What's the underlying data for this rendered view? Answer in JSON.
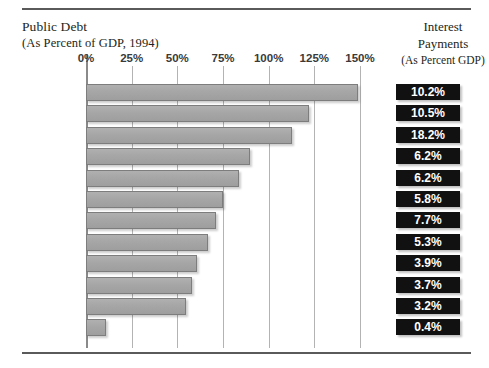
{
  "header": {
    "left_title": "Public Debt",
    "left_subtitle": "(As Percent of GDP, 1994)",
    "right_title_line1": "Interest",
    "right_title_line2": "Payments",
    "right_subtitle": "(As Percent GDP)"
  },
  "chart_data": {
    "type": "bar",
    "orientation": "horizontal",
    "title": "Public Debt",
    "subtitle": "(As Percent of GDP, 1994)",
    "xlabel": "",
    "ylabel": "",
    "xlim": [
      0,
      150
    ],
    "grid": true,
    "legend": "none",
    "tick_labels": [
      "0%",
      "25%",
      "50%",
      "75%",
      "100%",
      "125%",
      "150%"
    ],
    "tick_values": [
      0,
      25,
      50,
      75,
      100,
      125,
      150
    ],
    "categories": [
      "Belgium",
      "Italy",
      "Greece",
      "Ireland",
      "Holland",
      "Portugal",
      "Denmark",
      "Spain",
      "France",
      "Germany",
      "Britain",
      "Luxembourg"
    ],
    "values": [
      149,
      122,
      113,
      90,
      84,
      75,
      71,
      67,
      61,
      58,
      55,
      11
    ],
    "series": [
      {
        "name": "Public Debt (As Percent of GDP, 1994)",
        "values": [
          149,
          122,
          113,
          90,
          84,
          75,
          71,
          67,
          61,
          58,
          55,
          11
        ]
      },
      {
        "name": "Interest Payments (As Percent GDP)",
        "values": [
          10.2,
          10.5,
          18.2,
          6.2,
          6.2,
          5.8,
          7.7,
          5.3,
          3.9,
          3.7,
          3.2,
          0.4
        ],
        "labels": [
          "10.2%",
          "10.5%",
          "18.2%",
          "6.2%",
          "6.2%",
          "5.8%",
          "7.7%",
          "5.3%",
          "3.9%",
          "3.7%",
          "3.2%",
          "0.4%"
        ]
      }
    ],
    "rows": [
      {
        "country": "Belgium",
        "debt": 149,
        "interest": "10.2%"
      },
      {
        "country": "Italy",
        "debt": 122,
        "interest": "10.5%"
      },
      {
        "country": "Greece",
        "debt": 113,
        "interest": "18.2%"
      },
      {
        "country": "Ireland",
        "debt": 90,
        "interest": "6.2%"
      },
      {
        "country": "Holland",
        "debt": 84,
        "interest": "6.2%"
      },
      {
        "country": "Portugal",
        "debt": 75,
        "interest": "5.8%"
      },
      {
        "country": "Denmark",
        "debt": 71,
        "interest": "7.7%"
      },
      {
        "country": "Spain",
        "debt": 67,
        "interest": "5.3%"
      },
      {
        "country": "France",
        "debt": 61,
        "interest": "3.9%"
      },
      {
        "country": "Germany",
        "debt": 58,
        "interest": "3.7%"
      },
      {
        "country": "Britain",
        "debt": 55,
        "interest": "3.2%"
      },
      {
        "country": "Luxembourg",
        "debt": 11,
        "interest": "0.4%"
      }
    ],
    "colors": {
      "bar_fill": "#a8a8a8",
      "bar_border": "#7d7d7d",
      "badge_background": "#111111",
      "badge_text": "#ffffff",
      "gridline": "#b3b3b3",
      "rule": "#5a5a5a",
      "text": "#231f20"
    }
  }
}
